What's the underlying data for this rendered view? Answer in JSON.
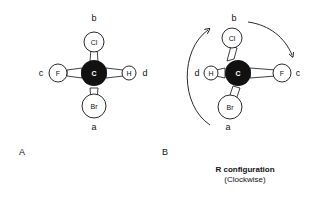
{
  "panels": [
    {
      "id": "A",
      "label": "A",
      "center_atom": "C",
      "substituents": [
        {
          "position": "top",
          "atom": "Cl",
          "label": "b"
        },
        {
          "position": "left",
          "atom": "F",
          "label": "c"
        },
        {
          "position": "right",
          "atom": "H",
          "label": "d"
        },
        {
          "position": "bottom",
          "atom": "Br",
          "label": "a"
        }
      ]
    },
    {
      "id": "B",
      "label": "B",
      "center_atom": "C",
      "substituents": [
        {
          "position": "top",
          "atom": "Cl",
          "label": "b"
        },
        {
          "position": "left",
          "atom": "H",
          "label": "d"
        },
        {
          "position": "right",
          "atom": "F",
          "label": "c"
        },
        {
          "position": "bottom",
          "atom": "Br",
          "label": "a"
        }
      ],
      "arrows": "clockwise a → b → c"
    }
  ],
  "caption": {
    "title": "R configuration",
    "subtitle": "(Clockwise)"
  }
}
